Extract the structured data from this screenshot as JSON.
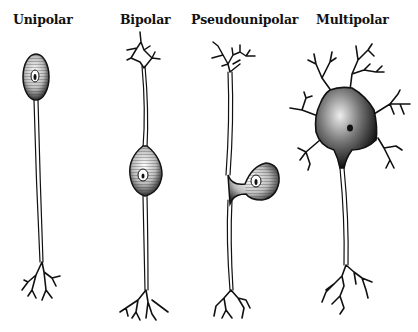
{
  "figure": {
    "labels": [
      {
        "id": "unipolar",
        "text": "Unipolar"
      },
      {
        "id": "bipolar",
        "text": "Bipolar"
      },
      {
        "id": "pseudounipolar",
        "text": "Pseudounipolar"
      },
      {
        "id": "multipolar",
        "text": "Multipolar"
      }
    ],
    "colors": {
      "ink": "#111111",
      "background": "#ffffff"
    }
  }
}
